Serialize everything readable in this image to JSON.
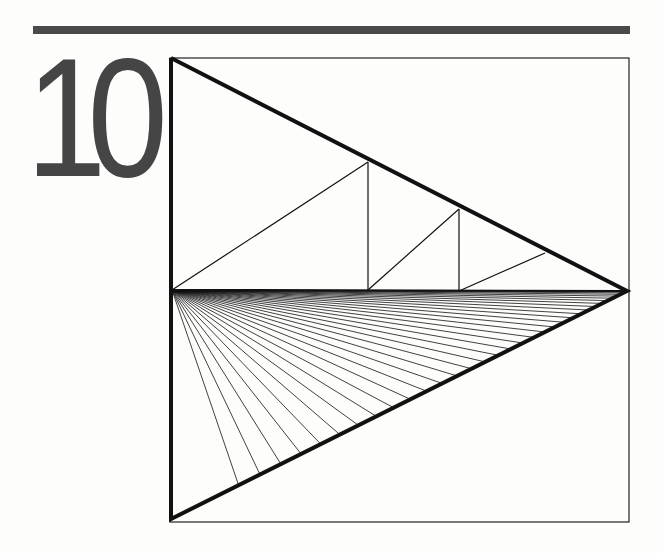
{
  "header": {
    "chapter_number": "10",
    "rule_color": "#4a4a4a",
    "number_color": "#454545"
  },
  "diagram": {
    "frame": {
      "x1": 170,
      "y1": 58,
      "x2": 629,
      "y2": 522,
      "stroke": 1.2
    },
    "triangle": {
      "top_left": [
        171,
        58
      ],
      "apex": [
        627,
        291
      ],
      "bottom_left": [
        171,
        519
      ],
      "left_mid": [
        171,
        290
      ],
      "stroke": 4
    },
    "midline": {
      "from": [
        171,
        290
      ],
      "to": [
        627,
        291
      ],
      "stroke": 2.2
    },
    "upper_steps": [
      {
        "diag_from": [
          172,
          290
        ],
        "diag_to": [
          368,
          162
        ],
        "vertical_x": 368,
        "vertical_top": 162,
        "vertical_bottom": 290
      },
      {
        "diag_from": [
          368,
          290
        ],
        "diag_to": [
          459,
          209
        ],
        "vertical_x": 459,
        "vertical_top": 209,
        "vertical_bottom": 291
      },
      {
        "diag_from": [
          459,
          291
        ],
        "diag_to": [
          545,
          253
        ]
      }
    ],
    "fan": {
      "origin": [
        172,
        290
      ],
      "target_line_from": [
        171,
        519
      ],
      "target_line_to": [
        627,
        291
      ],
      "line_count": 34,
      "stroke": 0.8
    },
    "colors": {
      "ink": "#111111",
      "frame": "#222222"
    }
  }
}
